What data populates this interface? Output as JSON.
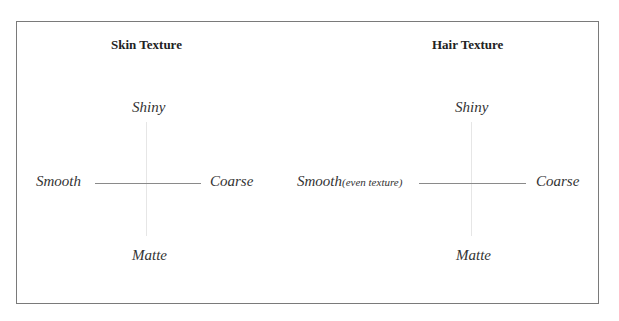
{
  "diagrams": [
    {
      "title": "Skin Texture",
      "axes": {
        "top": "Shiny",
        "bottom": "Matte",
        "left": "Smooth",
        "left_note": "",
        "right": "Coarse"
      }
    },
    {
      "title": "Hair Texture",
      "axes": {
        "top": "Shiny",
        "bottom": "Matte",
        "left": "Smooth",
        "left_note": "(even texture)",
        "right": "Coarse"
      }
    }
  ],
  "colors": {
    "border": "#7a7a7a",
    "horizontal_axis": "#8a8a8a",
    "vertical_axis": "#e6e6e6"
  }
}
